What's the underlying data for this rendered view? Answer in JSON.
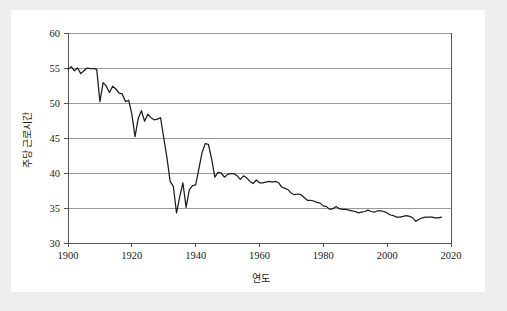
{
  "figure": {
    "background_color": "#eeeeee",
    "canvas_color": "#ffffff"
  },
  "chart_data": {
    "type": "line",
    "title": "",
    "xlabel": "연도",
    "ylabel": "주당 근로시간",
    "xlim": [
      1900,
      2020
    ],
    "ylim": [
      30,
      60
    ],
    "xticks": [
      1900,
      1920,
      1940,
      1960,
      1980,
      2000,
      2020
    ],
    "xtick_labels": [
      "1900",
      "1920",
      "1940",
      "1960",
      "1980",
      "2000",
      "2020"
    ],
    "yticks": [
      30,
      35,
      40,
      45,
      50,
      55,
      60
    ],
    "ytick_labels": [
      "30",
      "35",
      "40",
      "45",
      "50",
      "55",
      "60"
    ],
    "grid": "horizontal",
    "legend": "none",
    "line_color": "#1c1c1c",
    "gridline_color": "#9a9a9a",
    "series": [
      {
        "name": "주당 근로시간",
        "x": [
          1900,
          1901,
          1902,
          1903,
          1904,
          1905,
          1906,
          1907,
          1908,
          1909,
          1910,
          1911,
          1912,
          1913,
          1914,
          1915,
          1916,
          1917,
          1918,
          1919,
          1920,
          1921,
          1922,
          1923,
          1924,
          1925,
          1926,
          1927,
          1928,
          1929,
          1930,
          1931,
          1932,
          1933,
          1934,
          1935,
          1936,
          1937,
          1938,
          1939,
          1940,
          1941,
          1942,
          1943,
          1944,
          1945,
          1946,
          1947,
          1948,
          1949,
          1950,
          1951,
          1952,
          1953,
          1954,
          1955,
          1956,
          1957,
          1958,
          1959,
          1960,
          1961,
          1962,
          1963,
          1964,
          1965,
          1966,
          1967,
          1968,
          1969,
          1970,
          1971,
          1972,
          1973,
          1974,
          1975,
          1976,
          1977,
          1978,
          1979,
          1980,
          1981,
          1982,
          1983,
          1984,
          1985,
          1986,
          1987,
          1988,
          1989,
          1990,
          1991,
          1992,
          1993,
          1994,
          1995,
          1996,
          1997,
          1998,
          1999,
          2000,
          2001,
          2002,
          2003,
          2004,
          2005,
          2006,
          2007,
          2008,
          2009,
          2010,
          2011,
          2012,
          2013,
          2014,
          2015,
          2016,
          2017
        ],
        "values": [
          54.8,
          55.2,
          54.6,
          55.0,
          54.2,
          54.6,
          55.0,
          54.9,
          54.9,
          54.8,
          50.2,
          52.9,
          52.4,
          51.5,
          52.4,
          52.0,
          51.4,
          51.3,
          50.2,
          50.4,
          48.4,
          45.2,
          47.8,
          48.9,
          47.4,
          48.4,
          47.9,
          47.6,
          47.7,
          47.9,
          45.0,
          42.2,
          38.8,
          38.1,
          34.3,
          36.6,
          38.6,
          35.1,
          37.6,
          38.2,
          38.3,
          40.6,
          42.9,
          44.2,
          44.1,
          42.0,
          39.4,
          40.1,
          40.0,
          39.4,
          39.8,
          39.9,
          39.9,
          39.6,
          39.1,
          39.6,
          39.3,
          38.8,
          38.5,
          39.0,
          38.6,
          38.6,
          38.7,
          38.8,
          38.7,
          38.8,
          38.6,
          38.0,
          37.8,
          37.6,
          37.1,
          36.9,
          37.0,
          36.9,
          36.5,
          36.1,
          36.1,
          36.0,
          35.8,
          35.7,
          35.3,
          35.2,
          34.8,
          34.9,
          35.2,
          34.9,
          34.8,
          34.8,
          34.7,
          34.6,
          34.5,
          34.3,
          34.4,
          34.5,
          34.7,
          34.5,
          34.4,
          34.6,
          34.6,
          34.5,
          34.3,
          34.0,
          33.9,
          33.7,
          33.7,
          33.8,
          33.9,
          33.8,
          33.6,
          33.1,
          33.4,
          33.6,
          33.7,
          33.7,
          33.7,
          33.6,
          33.6,
          33.7
        ]
      }
    ]
  }
}
